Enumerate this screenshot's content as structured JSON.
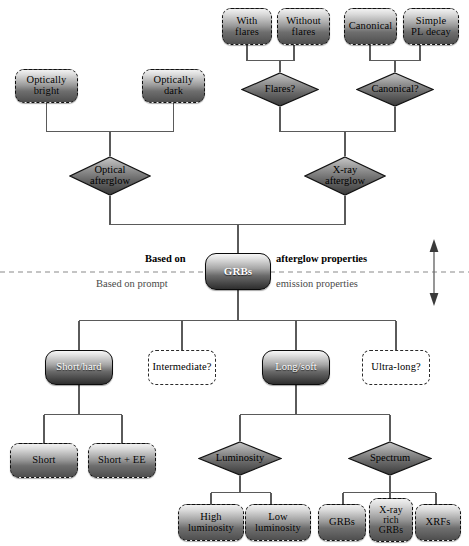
{
  "diagram": {
    "colors": {
      "line": "#5a5a5a",
      "divider": "#7a7a7a",
      "node_border": "#101010",
      "text": "#000000",
      "grey_text": "#4a4a4a"
    }
  },
  "divider": {
    "above_bold": "Based on",
    "above_bold_right": "afterglow properties",
    "below_left": "Based on prompt",
    "below_right": "emission properties",
    "arrow_icon": "double-arrow-vertical-icon"
  },
  "nodes": {
    "with_flares": {
      "label": "With\nflares",
      "shape": "rounded-box-dashed"
    },
    "without_flares": {
      "label": "Without\nflares",
      "shape": "rounded-box-dashed"
    },
    "canonical": {
      "label": "Canonical",
      "shape": "rounded-box-dashed"
    },
    "simple_pl_decay": {
      "label": "Simple\nPL decay",
      "shape": "rounded-box-dashed"
    },
    "optically_bright": {
      "label": "Optically\nbright",
      "shape": "rounded-box-dashed"
    },
    "optically_dark": {
      "label": "Optically\ndark",
      "shape": "rounded-box-dashed"
    },
    "flares_q": {
      "label": "Flares?",
      "shape": "diamond"
    },
    "canonical_q": {
      "label": "Canonical?",
      "shape": "diamond"
    },
    "optical_afterglow": {
      "label": "Optical\nafterglow",
      "shape": "diamond"
    },
    "xray_afterglow": {
      "label": "X-ray\nafterglow",
      "shape": "diamond"
    },
    "grbs_root": {
      "label": "GRBs",
      "shape": "rounded-box-solid"
    },
    "short_hard": {
      "label": "Short/hard",
      "shape": "rounded-box-solid"
    },
    "intermediate": {
      "label": "Intermediate?",
      "shape": "rounded-box-hollow"
    },
    "long_soft": {
      "label": "Long/soft",
      "shape": "rounded-box-solid"
    },
    "ultra_long": {
      "label": "Ultra-long?",
      "shape": "rounded-box-hollow"
    },
    "short": {
      "label": "Short",
      "shape": "rounded-box-dashed"
    },
    "short_ee": {
      "label": "Short + EE",
      "shape": "rounded-box-dashed"
    },
    "luminosity_q": {
      "label": "Luminosity",
      "shape": "diamond"
    },
    "spectrum_q": {
      "label": "Spectrum",
      "shape": "diamond"
    },
    "high_luminosity": {
      "label": "High\nluminosity",
      "shape": "rounded-box-dashed"
    },
    "low_luminosity": {
      "label": "Low\nluminosity",
      "shape": "rounded-box-dashed"
    },
    "grbs_leaf": {
      "label": "GRBs",
      "shape": "rounded-box-dashed"
    },
    "xray_rich_grbs": {
      "label": "X-ray\nrich\nGRBs",
      "shape": "rounded-box-dashed"
    },
    "xrfs": {
      "label": "XRFs",
      "shape": "rounded-box-dashed"
    }
  }
}
